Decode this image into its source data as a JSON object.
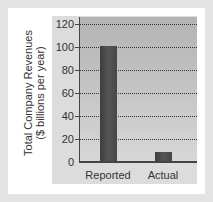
{
  "chart_data": {
    "type": "bar",
    "title": "",
    "xlabel": "",
    "ylabel": "Total Company Revenues ($ billions per year)",
    "ylabel_lines": [
      "Total Company Revenues",
      "($ billions per year)"
    ],
    "categories": [
      "Reported",
      "Actual"
    ],
    "values": [
      101,
      9
    ],
    "ylim": [
      0,
      120
    ],
    "yticks": [
      0,
      20,
      40,
      60,
      80,
      100,
      120
    ],
    "grid": true,
    "grid_style": "dotted horizontal",
    "legend": null
  },
  "colors": {
    "frame": "#e3e3e3",
    "card": "#ffffff",
    "panel": "#dcdcdc",
    "plot_top": "#b3b3b3",
    "plot_bottom": "#d8d8d8",
    "bar": "#4a4a4a"
  }
}
